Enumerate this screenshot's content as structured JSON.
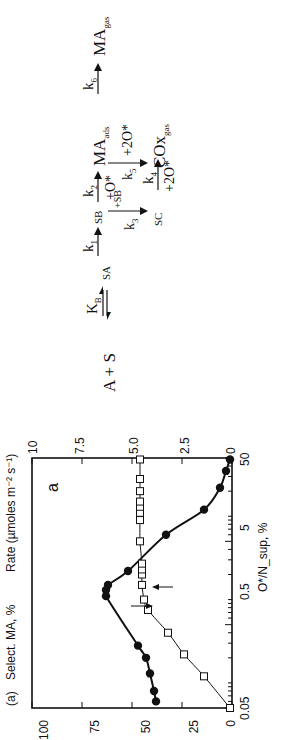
{
  "panel_label": "(a)",
  "chart_data": {
    "type": "line",
    "title": "",
    "panel_letter": "a",
    "xlabel": "O*/N_sup, %",
    "xscale": "log",
    "xlim": [
      0.05,
      50
    ],
    "x_ticks": [
      "0.05",
      "0.5",
      "5",
      "50"
    ],
    "ylabel_left": "Select. MA, %",
    "ylim_left": [
      0,
      100
    ],
    "y_ticks_left": [
      "0",
      "25",
      "50",
      "75",
      "100"
    ],
    "ylabel_right": "Rate (µmoles m⁻² s⁻¹)",
    "ylim_right": [
      0,
      10
    ],
    "y_ticks_right": [
      "0",
      "2.5",
      "5.0",
      "7.5",
      "10"
    ],
    "series": [
      {
        "name": "Selectivity MA (filled circles, left axis)",
        "marker": "filled-circle",
        "axis": "left",
        "x": [
          0.06,
          0.08,
          0.13,
          0.2,
          0.28,
          1.1,
          1.3,
          1.5,
          2.2,
          6,
          12,
          22,
          35,
          48
        ],
        "y": [
          38,
          39,
          41,
          43,
          47,
          63,
          63,
          62,
          52,
          33,
          14,
          6,
          3,
          1
        ]
      },
      {
        "name": "Rate (open squares, right axis)",
        "marker": "open-square",
        "axis": "right",
        "x": [
          0.05,
          0.12,
          0.22,
          0.4,
          0.75,
          1.0,
          1.5,
          2.0,
          2.3,
          2.7,
          5,
          9,
          11,
          13,
          15,
          20,
          28,
          48
        ],
        "y": [
          0.1,
          1.4,
          2.4,
          3.2,
          4.2,
          4.4,
          4.5,
          4.5,
          4.5,
          4.5,
          4.6,
          4.6,
          4.6,
          4.6,
          4.6,
          4.6,
          4.6,
          4.6
        ]
      }
    ],
    "annotations": [
      "arrow pointing to left axis on circle curve",
      "arrow pointing to right axis on square curve"
    ]
  },
  "scheme": {
    "species": {
      "start": "A + S",
      "sa": "SA",
      "sb": "SB",
      "sc": "SC",
      "ma_ads": "MA",
      "ma_ads_sub": "ads",
      "cox": "COx",
      "cox_sub": "gas",
      "ma_gas": "MA",
      "ma_gas_sub": "gas"
    },
    "steps": {
      "kb": "K",
      "kb_sub": "B",
      "k1": "k",
      "k1_sub": "1",
      "k2": "k",
      "k2_sub": "2",
      "k2_reagent": "+O*",
      "k3": "k",
      "k3_sub": "3",
      "k3_reagent": "+SB",
      "k4": "k",
      "k4_sub": "4",
      "k4_reagent": "+2O*",
      "k5": "k",
      "k5_sub": "5",
      "k5_reagent": "+2O*",
      "k6": "k",
      "k6_sub": "6"
    }
  }
}
